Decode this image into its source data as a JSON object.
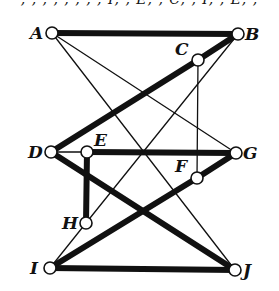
{
  "top_text_fragment": ", , , , , , , , I, , E, , C, , I, , E, ,",
  "colors": {
    "line": "#111111",
    "node_fill": "#ffffff",
    "background": "#ffffff"
  },
  "nodes": [
    {
      "id": "A",
      "label": "A",
      "x": 52,
      "y": 33,
      "lx": 30,
      "ly": 39
    },
    {
      "id": "B",
      "label": "B",
      "x": 238,
      "y": 34,
      "lx": 245,
      "ly": 40
    },
    {
      "id": "C",
      "label": "C",
      "x": 198,
      "y": 60,
      "lx": 175,
      "ly": 55
    },
    {
      "id": "D",
      "label": "D",
      "x": 51,
      "y": 152,
      "lx": 28,
      "ly": 158
    },
    {
      "id": "E",
      "label": "E",
      "x": 87,
      "y": 152,
      "lx": 94,
      "ly": 146
    },
    {
      "id": "F",
      "label": "F",
      "x": 197,
      "y": 178,
      "lx": 175,
      "ly": 172
    },
    {
      "id": "G",
      "label": "G",
      "x": 236,
      "y": 153,
      "lx": 243,
      "ly": 159
    },
    {
      "id": "H",
      "label": "H",
      "x": 86,
      "y": 223,
      "lx": 62,
      "ly": 229
    },
    {
      "id": "I",
      "label": "I",
      "x": 50,
      "y": 268,
      "lx": 30,
      "ly": 274
    },
    {
      "id": "J",
      "label": "J",
      "x": 235,
      "y": 270,
      "lx": 243,
      "ly": 276
    }
  ],
  "edges": [
    {
      "from": "A",
      "to": "B",
      "weight": "thick"
    },
    {
      "from": "B",
      "to": "C",
      "weight": "thick"
    },
    {
      "from": "C",
      "to": "D",
      "weight": "thick"
    },
    {
      "from": "E",
      "to": "G",
      "weight": "thick"
    },
    {
      "from": "E",
      "to": "H",
      "weight": "thick"
    },
    {
      "from": "D",
      "to": "J",
      "weight": "thick"
    },
    {
      "from": "I",
      "to": "F",
      "weight": "thick"
    },
    {
      "from": "F",
      "to": "G",
      "weight": "thick"
    },
    {
      "from": "I",
      "to": "J",
      "weight": "thick"
    },
    {
      "from": "A",
      "to": "G",
      "weight": "thin"
    },
    {
      "from": "A",
      "to": "J",
      "weight": "thin"
    },
    {
      "from": "B",
      "to": "H",
      "weight": "thin"
    },
    {
      "from": "H",
      "to": "I",
      "weight": "thin"
    },
    {
      "from": "C",
      "to": "F",
      "weight": "thin"
    },
    {
      "from": "D",
      "to": "E",
      "weight": "thin"
    }
  ]
}
